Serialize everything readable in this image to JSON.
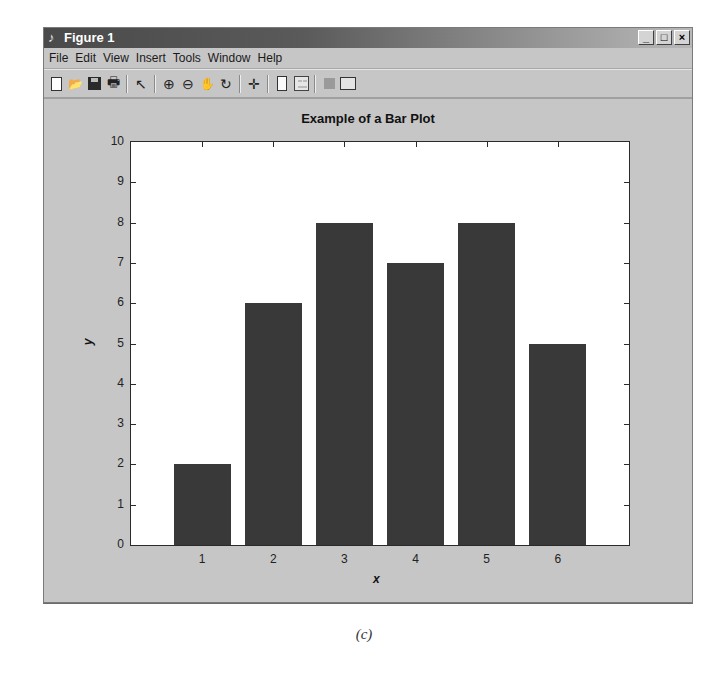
{
  "window": {
    "title": "Figure 1",
    "title_icon": "matlab-figure-icon",
    "controls": {
      "minimize": "_",
      "maximize": "□",
      "close": "×"
    }
  },
  "menubar": {
    "items": [
      {
        "label": "File"
      },
      {
        "label": "Edit"
      },
      {
        "label": "View"
      },
      {
        "label": "Insert"
      },
      {
        "label": "Tools"
      },
      {
        "label": "Window"
      },
      {
        "label": "Help"
      }
    ]
  },
  "toolbar": {
    "buttons": [
      {
        "name": "new-figure",
        "icon": "new-page-icon"
      },
      {
        "name": "open-file",
        "icon": "folder-open-icon"
      },
      {
        "name": "save-figure",
        "icon": "save-disk-icon"
      },
      {
        "name": "print-figure",
        "icon": "printer-icon"
      },
      {
        "name": "edit-plot",
        "icon": "pointer-arrow-icon"
      },
      {
        "name": "zoom-in",
        "icon": "zoom-in-icon"
      },
      {
        "name": "zoom-out",
        "icon": "zoom-out-icon"
      },
      {
        "name": "pan",
        "icon": "hand-pan-icon"
      },
      {
        "name": "rotate-3d",
        "icon": "rotate-3d-icon"
      },
      {
        "name": "data-cursor",
        "icon": "data-cursor-icon"
      },
      {
        "name": "insert-colorbar",
        "icon": "colorbar-icon"
      },
      {
        "name": "insert-legend",
        "icon": "legend-icon"
      },
      {
        "name": "hide-plot-tools",
        "icon": "hide-tools-icon"
      },
      {
        "name": "show-plot-tools",
        "icon": "show-tools-icon"
      }
    ],
    "glyphs": {
      "open": "📂",
      "print": "🖶",
      "pointer": "↖",
      "zoom_in": "⊕",
      "zoom_out": "⊖",
      "pan": "✋",
      "rotate": "↻",
      "cursor": "✛"
    }
  },
  "colors": {
    "bar": "#393939",
    "figure_bg": "#c6c6c6",
    "axes_bg": "#ffffff"
  },
  "chart_data": {
    "type": "bar",
    "title": "Example of a Bar Plot",
    "xlabel": "x",
    "ylabel": "y",
    "categories": [
      "1",
      "2",
      "3",
      "4",
      "5",
      "6"
    ],
    "values": [
      2,
      6,
      8,
      7,
      8,
      5
    ],
    "ylim": [
      0,
      10
    ],
    "yticks": [
      "0",
      "1",
      "2",
      "3",
      "4",
      "5",
      "6",
      "7",
      "8",
      "9",
      "10"
    ],
    "xlim": [
      0,
      7
    ],
    "grid": false,
    "legend": null
  },
  "caption": "(c)"
}
